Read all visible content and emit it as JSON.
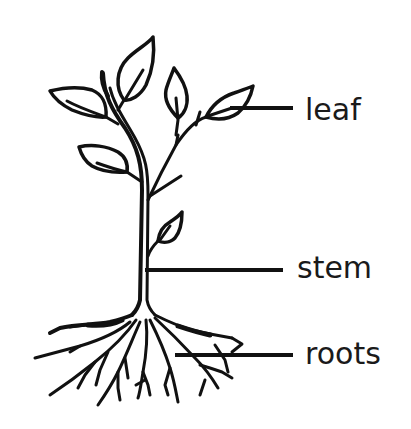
{
  "diagram": {
    "labels": [
      {
        "id": "leaf",
        "text": "leaf"
      },
      {
        "id": "stem",
        "text": "stem"
      },
      {
        "id": "roots",
        "text": "roots"
      }
    ]
  },
  "colors": {
    "background": "#ffffff",
    "ink": "#111111"
  }
}
